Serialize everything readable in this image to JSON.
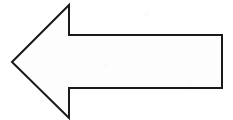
{
  "canvas": {
    "width": 233,
    "height": 120,
    "background_color": "#ffffff",
    "alt_text": "Left-pointing block arrow outline"
  },
  "figure": {
    "name": "left-arrow",
    "label": "Left-pointing arrow",
    "stroke_color": "#1a1a1a",
    "fill_color": "#fdfdfd",
    "stroke_width": 2,
    "direction": "left",
    "points": "12,62 69,5 69,35 222,35 222,88 69,88 69,118",
    "vertices": [
      {
        "name": "tip",
        "x": 12,
        "y": 62
      },
      {
        "name": "head-top-apex",
        "x": 69,
        "y": 5
      },
      {
        "name": "head-top-shoulder",
        "x": 69,
        "y": 35
      },
      {
        "name": "shaft-top-right",
        "x": 222,
        "y": 35
      },
      {
        "name": "shaft-bottom-right",
        "x": 222,
        "y": 88
      },
      {
        "name": "head-bottom-shoulder",
        "x": 69,
        "y": 88
      },
      {
        "name": "head-bottom-apex",
        "x": 69,
        "y": 118
      }
    ]
  }
}
